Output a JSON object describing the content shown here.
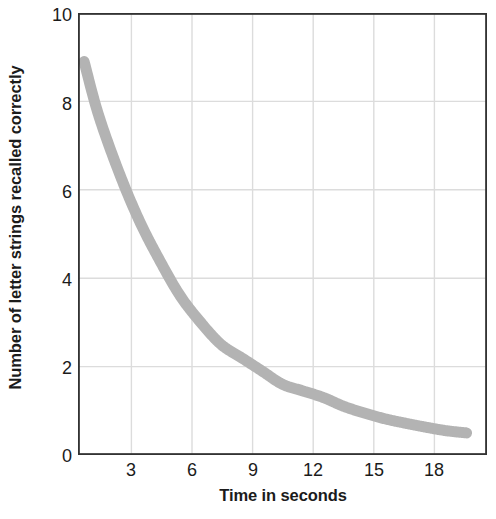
{
  "chart_data": {
    "type": "line",
    "title": "",
    "subtitle": "",
    "xlabel": "Time in seconds",
    "ylabel": "Number of letter strings recalled correctly",
    "xlim": [
      0,
      20
    ],
    "ylim": [
      0,
      10
    ],
    "xticks": [
      3,
      6,
      9,
      12,
      15,
      18
    ],
    "yticks": [
      0,
      2,
      4,
      6,
      8,
      10
    ],
    "xtick_labels": [
      "3",
      "6",
      "9",
      "12",
      "15",
      "18"
    ],
    "ytick_labels": [
      "0",
      "2",
      "4",
      "6",
      "8",
      "10"
    ],
    "grid": true,
    "legend": "none",
    "series": [
      {
        "name": "Recall decay",
        "color": "#b3b3b3",
        "line_width": 11,
        "x": [
          0.3,
          1,
          2,
          3,
          4,
          5,
          6,
          7,
          8,
          9,
          10,
          11,
          12,
          13,
          14,
          15,
          16,
          17,
          18,
          19
        ],
        "y": [
          8.9,
          7.7,
          6.4,
          5.3,
          4.4,
          3.6,
          3.0,
          2.5,
          2.2,
          1.9,
          1.6,
          1.45,
          1.3,
          1.1,
          0.95,
          0.82,
          0.72,
          0.63,
          0.55,
          0.5
        ]
      }
    ],
    "annotations": []
  },
  "axes": {
    "frame_color": "#333333",
    "grid_color": "#d9d9d9",
    "background": "#ffffff"
  }
}
